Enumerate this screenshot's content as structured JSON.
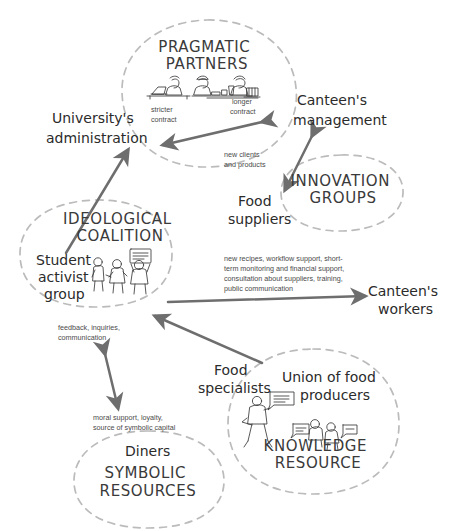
{
  "diagram": {
    "style": {
      "background": "#ffffff",
      "cluster_outline_color": "#b9b9b9",
      "arrow_color": "#6e6e6e",
      "handwritten_text_color": "#2b2b2b",
      "typed_note_color": "#4a4a4a"
    },
    "clusters": [
      {
        "id": "pragmatic-partners",
        "label_line1": "PRAGMATIC",
        "label_line2": "PARTNERS",
        "shape": "circle",
        "icon": "three-workers-at-desks-icon"
      },
      {
        "id": "innovation-groups",
        "label_line1": "INNOVATION",
        "label_line2": "GROUPS",
        "shape": "ellipse",
        "icon": null
      },
      {
        "id": "ideological-coalition",
        "label_line1": "IDEOLOGICAL",
        "label_line2": "COALITION",
        "shape": "ellipse",
        "icon": "three-protesters-with-placard-icon"
      },
      {
        "id": "knowledge-resource",
        "label_line1": "KNOWLEDGE",
        "label_line2": "RESOURCE",
        "shape": "ellipse",
        "icon": "speaker-with-slide-and-two-people-talking-icon"
      },
      {
        "id": "symbolic-resources",
        "label_line1": "SYMBOLIC",
        "label_line2": "RESOURCES",
        "shape": "ellipse",
        "icon": null
      }
    ],
    "actors": [
      {
        "id": "university-administration",
        "line1": "University's",
        "line2": "administration"
      },
      {
        "id": "canteens-management",
        "line1": "Canteen's",
        "line2": "management"
      },
      {
        "id": "food-suppliers",
        "line1": "Food",
        "line2": "suppliers"
      },
      {
        "id": "student-activist-group",
        "line1": "Student",
        "line2": "activist",
        "line3": "group"
      },
      {
        "id": "canteens-workers",
        "line1": "Canteen's",
        "line2": "workers"
      },
      {
        "id": "food-specialists",
        "line1": "Food",
        "line2": "specialists"
      },
      {
        "id": "union-of-food-producers",
        "line1": "Union of food",
        "line2": "producers"
      },
      {
        "id": "diners",
        "line1": "Diners",
        "line2": ""
      }
    ],
    "flow_labels": [
      {
        "id": "stricter-contract",
        "lines": [
          "stricter",
          "contract"
        ]
      },
      {
        "id": "longer-contract",
        "lines": [
          "longer",
          "contract"
        ]
      },
      {
        "id": "new-clients-and-products",
        "lines": [
          "new clients",
          "and products"
        ]
      },
      {
        "id": "support-package",
        "lines": [
          "new recipes, workflow support, short-",
          "term monitoring and financial support,",
          "consultation about suppliers, training,",
          "public communication"
        ]
      },
      {
        "id": "feedback-inquiries",
        "lines": [
          "feedback, inquiries,",
          "communication"
        ]
      },
      {
        "id": "moral-support",
        "lines": [
          "moral support, loyalty,",
          "source of symbolic capital"
        ]
      }
    ],
    "arrows": [
      {
        "id": "arrow-management-to-administration",
        "from": "canteens-management",
        "to": "university-administration",
        "heads": "double"
      },
      {
        "id": "arrow-management-to-food-suppliers",
        "from": "canteens-management",
        "to": "food-suppliers",
        "heads": "double"
      },
      {
        "id": "arrow-coalition-to-administration",
        "from": "student-activist-group",
        "to": "university-administration",
        "heads": "single"
      },
      {
        "id": "arrow-coalition-to-workers",
        "from": "ideological-coalition",
        "to": "canteens-workers",
        "heads": "single"
      },
      {
        "id": "arrow-knowledge-to-coalition",
        "from": "knowledge-resource",
        "to": "ideological-coalition",
        "heads": "single"
      },
      {
        "id": "arrow-coalition-diners",
        "from": "ideological-coalition",
        "to": "symbolic-resources",
        "heads": "double"
      }
    ]
  }
}
